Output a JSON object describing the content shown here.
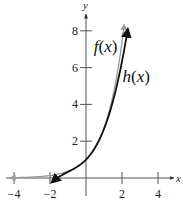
{
  "chart_data": {
    "type": "line",
    "title": "",
    "xlabel": "x",
    "ylabel": "y",
    "xlim": [
      -4.4,
      5
    ],
    "ylim": [
      -0.6,
      8.9
    ],
    "x_ticks": [
      -4,
      -2,
      2,
      4
    ],
    "x_tick_labels": [
      "−4",
      "−2",
      "2",
      "4"
    ],
    "y_ticks": [
      2,
      4,
      6,
      8
    ],
    "y_tick_labels": [
      "2",
      "4",
      "6",
      "8"
    ],
    "grid": false,
    "legend": "none (inline curve labels)",
    "series": [
      {
        "name": "f(x)",
        "label_parts": [
          "f",
          "(",
          "x",
          ")"
        ],
        "description": "e^x",
        "color": "#9a9a9a",
        "x_range": [
          -4.2,
          2.12
        ],
        "points": [
          {
            "x": -4.2,
            "y": 0.015
          },
          {
            "x": -3,
            "y": 0.05
          },
          {
            "x": -2,
            "y": 0.135
          },
          {
            "x": -1,
            "y": 0.368
          },
          {
            "x": 0,
            "y": 1.0
          },
          {
            "x": 1,
            "y": 2.718
          },
          {
            "x": 1.5,
            "y": 4.48
          },
          {
            "x": 2,
            "y": 7.39
          },
          {
            "x": 2.12,
            "y": 8.33
          }
        ]
      },
      {
        "name": "h(x)",
        "label_parts": [
          "h",
          "(",
          "x",
          ")"
        ],
        "description": "1 + x + x^2/2 + x^3/6",
        "color": "#111111",
        "x_range": [
          -1.9,
          2.32
        ],
        "points": [
          {
            "x": -1.9,
            "y": -0.24
          },
          {
            "x": -1.5,
            "y": 0.06
          },
          {
            "x": -1,
            "y": 0.333
          },
          {
            "x": 0,
            "y": 1.0
          },
          {
            "x": 1,
            "y": 2.667
          },
          {
            "x": 1.5,
            "y": 4.19
          },
          {
            "x": 2,
            "y": 6.333
          },
          {
            "x": 2.32,
            "y": 8.0
          }
        ]
      }
    ],
    "annotations": [
      {
        "text": "f(x)",
        "x": 1.1,
        "y": 7.1
      },
      {
        "text": "h(x)",
        "x": 2.7,
        "y": 5.5
      }
    ]
  }
}
